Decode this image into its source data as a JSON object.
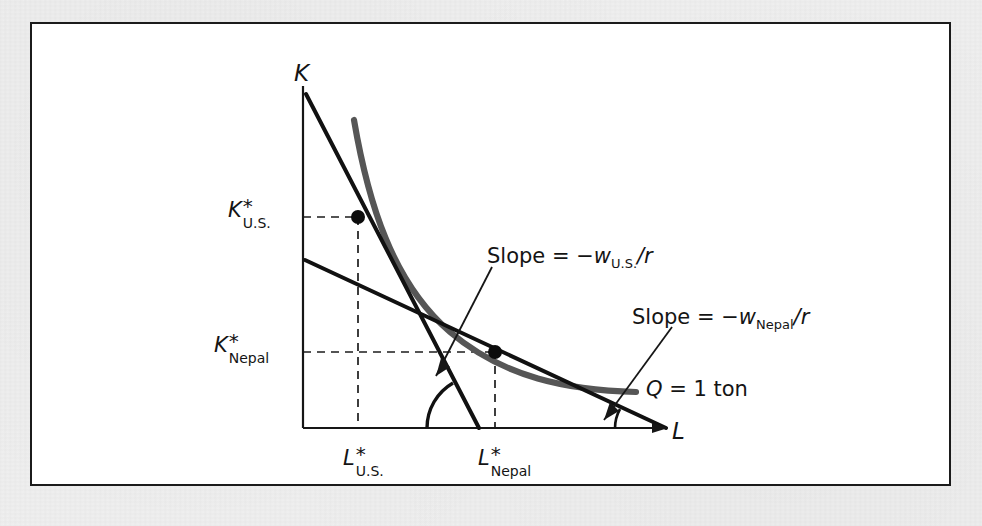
{
  "figure": {
    "type": "economics-isoquant-isocost-diagram",
    "axes": {
      "y_axis_label": "K",
      "x_axis_label": "L"
    },
    "colors": {
      "ink": "#141414",
      "isoquant_gray": "#565656",
      "frame_border": "#1b1b1b",
      "page_background": "#f1f1f1",
      "figure_background": "#ffffff"
    },
    "axis_value_labels": {
      "k_us": {
        "var": "K",
        "star": "*",
        "sub": "U.S."
      },
      "k_nepal": {
        "var": "K",
        "star": "*",
        "sub": "Nepal"
      },
      "l_us": {
        "var": "L",
        "star": "*",
        "sub": "U.S."
      },
      "l_nepal": {
        "var": "L",
        "star": "*",
        "sub": "Nepal"
      }
    },
    "annotations": {
      "slope_us": {
        "prefix": "Slope = −",
        "var": "w",
        "sub": "U.S.",
        "suffix": "/r"
      },
      "slope_nepal": {
        "prefix": "Slope = −",
        "var": "w",
        "sub": "Nepal",
        "suffix": "/r"
      },
      "isoquant": {
        "var": "Q",
        "text": " = 1 ton"
      }
    },
    "tangency_points": [
      {
        "name": "U.S. cost-minimizing input bundle",
        "x_label": "L*U.S.",
        "y_label": "K*U.S."
      },
      {
        "name": "Nepal cost-minimizing input bundle",
        "x_label": "L*Nepal",
        "y_label": "K*Nepal"
      }
    ],
    "curves": [
      {
        "name": "isoquant-q-1-ton",
        "style": "thick gray convex curve"
      },
      {
        "name": "isocost-us",
        "style": "steep black straight line"
      },
      {
        "name": "isocost-nepal",
        "style": "shallow black straight line"
      }
    ]
  }
}
